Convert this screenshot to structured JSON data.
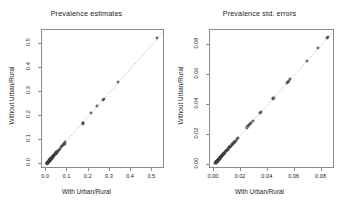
{
  "figure": {
    "background": "#ffffff",
    "point_color": "#3d3d3d",
    "axis_color": "#8c8c8c",
    "text_color": "#1a1a1a"
  },
  "panels": [
    {
      "title": "Prevalence estimates",
      "xlabel": "With Urban/Rural",
      "ylabel": "Without Urban/Rural",
      "xticks": [
        "0.0",
        "0.1",
        "0.2",
        "0.3",
        "0.4",
        "0.5"
      ],
      "yticks": [
        "0.0",
        "0.1",
        "0.2",
        "0.3",
        "0.4",
        "0.5"
      ]
    },
    {
      "title": "Prevalence std. errors",
      "xlabel": "With Urban/Rural",
      "ylabel": "Without Urban/Rural",
      "xticks": [
        "0.00",
        "0.02",
        "0.04",
        "0.06",
        "0.08"
      ],
      "yticks": [
        "0.00",
        "0.02",
        "0.04",
        "0.06",
        "0.08"
      ]
    }
  ],
  "chart_data": [
    {
      "type": "scatter",
      "title": "Prevalence estimates",
      "xlabel": "With Urban/Rural",
      "ylabel": "Without Urban/Rural",
      "xlim": [
        -0.02,
        0.56
      ],
      "ylim": [
        -0.02,
        0.56
      ],
      "xticks": [
        0.0,
        0.1,
        0.2,
        0.3,
        0.4,
        0.5
      ],
      "yticks": [
        0.0,
        0.1,
        0.2,
        0.3,
        0.4,
        0.5
      ],
      "grid": false,
      "legend": null,
      "reference_line": {
        "type": "identity",
        "style": "dotted",
        "slope": 1,
        "intercept": 0
      },
      "marker": "open-circle",
      "x": [
        0.003,
        0.004,
        0.004,
        0.005,
        0.005,
        0.006,
        0.006,
        0.007,
        0.007,
        0.008,
        0.008,
        0.009,
        0.009,
        0.01,
        0.01,
        0.011,
        0.011,
        0.012,
        0.012,
        0.013,
        0.013,
        0.014,
        0.014,
        0.015,
        0.015,
        0.016,
        0.016,
        0.017,
        0.018,
        0.018,
        0.019,
        0.02,
        0.02,
        0.021,
        0.022,
        0.023,
        0.024,
        0.025,
        0.026,
        0.027,
        0.028,
        0.029,
        0.03,
        0.031,
        0.032,
        0.033,
        0.034,
        0.036,
        0.038,
        0.04,
        0.042,
        0.044,
        0.046,
        0.048,
        0.05,
        0.055,
        0.06,
        0.064,
        0.07,
        0.074,
        0.078,
        0.082,
        0.086,
        0.09,
        0.172,
        0.175,
        0.21,
        0.24,
        0.268,
        0.272,
        0.34,
        0.52
      ],
      "y": [
        0.003,
        0.004,
        0.004,
        0.005,
        0.005,
        0.006,
        0.006,
        0.007,
        0.008,
        0.008,
        0.009,
        0.009,
        0.01,
        0.01,
        0.011,
        0.011,
        0.012,
        0.012,
        0.013,
        0.013,
        0.014,
        0.014,
        0.015,
        0.015,
        0.016,
        0.016,
        0.017,
        0.017,
        0.018,
        0.019,
        0.019,
        0.02,
        0.021,
        0.021,
        0.022,
        0.023,
        0.024,
        0.025,
        0.026,
        0.027,
        0.028,
        0.029,
        0.031,
        0.031,
        0.032,
        0.034,
        0.035,
        0.037,
        0.038,
        0.041,
        0.042,
        0.045,
        0.046,
        0.049,
        0.051,
        0.056,
        0.06,
        0.065,
        0.071,
        0.075,
        0.079,
        0.083,
        0.086,
        0.091,
        0.17,
        0.172,
        0.213,
        0.242,
        0.268,
        0.272,
        0.344,
        0.528
      ]
    },
    {
      "type": "scatter",
      "title": "Prevalence std. errors",
      "xlabel": "With Urban/Rural",
      "ylabel": "Without Urban/Rural",
      "xlim": [
        -0.003,
        0.09
      ],
      "ylim": [
        -0.003,
        0.09
      ],
      "xticks": [
        0.0,
        0.02,
        0.04,
        0.06,
        0.08
      ],
      "yticks": [
        0.0,
        0.02,
        0.04,
        0.06,
        0.08
      ],
      "grid": false,
      "legend": null,
      "reference_line": {
        "type": "identity",
        "style": "dotted",
        "slope": 1,
        "intercept": 0
      },
      "marker": "open-circle",
      "x": [
        0.001,
        0.0012,
        0.0014,
        0.0015,
        0.0016,
        0.0017,
        0.0018,
        0.0019,
        0.002,
        0.0021,
        0.0022,
        0.0023,
        0.0024,
        0.0025,
        0.0026,
        0.0027,
        0.0028,
        0.0029,
        0.003,
        0.0031,
        0.0032,
        0.0033,
        0.0034,
        0.0035,
        0.0036,
        0.0038,
        0.004,
        0.0042,
        0.0044,
        0.0046,
        0.0048,
        0.005,
        0.0052,
        0.0055,
        0.0058,
        0.006,
        0.0062,
        0.0065,
        0.0068,
        0.007,
        0.0073,
        0.0076,
        0.008,
        0.0084,
        0.0088,
        0.0092,
        0.0096,
        0.01,
        0.0105,
        0.011,
        0.0115,
        0.012,
        0.0125,
        0.013,
        0.0135,
        0.014,
        0.0145,
        0.015,
        0.0155,
        0.016,
        0.0168,
        0.0176,
        0.0245,
        0.0252,
        0.0262,
        0.027,
        0.0278,
        0.0288,
        0.0345,
        0.0348,
        0.0435,
        0.0442,
        0.0545,
        0.0552,
        0.056,
        0.0568,
        0.069,
        0.0772,
        0.084,
        0.0848
      ],
      "y": [
        0.001,
        0.0012,
        0.0014,
        0.0015,
        0.0016,
        0.0017,
        0.0018,
        0.0019,
        0.002,
        0.0021,
        0.0022,
        0.0023,
        0.0024,
        0.0025,
        0.0026,
        0.0027,
        0.0028,
        0.0029,
        0.003,
        0.0031,
        0.0032,
        0.0033,
        0.0034,
        0.0035,
        0.0036,
        0.0038,
        0.004,
        0.0042,
        0.0044,
        0.0046,
        0.0048,
        0.005,
        0.0052,
        0.0055,
        0.0058,
        0.006,
        0.0062,
        0.0065,
        0.0068,
        0.007,
        0.0073,
        0.0076,
        0.008,
        0.0084,
        0.0088,
        0.0092,
        0.0096,
        0.01,
        0.0105,
        0.011,
        0.0115,
        0.012,
        0.0125,
        0.013,
        0.0135,
        0.014,
        0.0145,
        0.015,
        0.0152,
        0.0158,
        0.017,
        0.0178,
        0.0248,
        0.0255,
        0.0265,
        0.0272,
        0.028,
        0.029,
        0.0348,
        0.0352,
        0.0438,
        0.0445,
        0.0548,
        0.0555,
        0.0562,
        0.0572,
        0.0695,
        0.0778,
        0.0848,
        0.0855
      ]
    }
  ]
}
